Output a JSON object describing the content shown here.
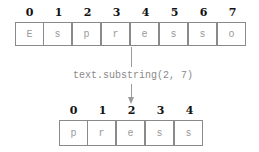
{
  "source": {
    "indices": [
      "0",
      "1",
      "2",
      "3",
      "4",
      "5",
      "6",
      "7"
    ],
    "chars": [
      "E",
      "s",
      "p",
      "r",
      "e",
      "s",
      "s",
      "o"
    ]
  },
  "operation": {
    "label": "text.substring(2, 7)"
  },
  "result": {
    "indices": [
      "0",
      "1",
      "2",
      "3",
      "4"
    ],
    "chars": [
      "p",
      "r",
      "e",
      "s",
      "s"
    ]
  }
}
